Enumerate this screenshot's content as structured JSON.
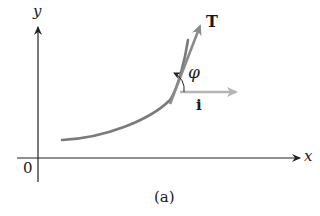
{
  "figure": {
    "caption": "(a)",
    "axes": {
      "x_label": "x",
      "y_label": "y",
      "origin_label": "0"
    },
    "vectors": {
      "tangent_label": "T",
      "unit_x_label": "i",
      "angle_label": "φ"
    },
    "colors": {
      "axis": "#222222",
      "curve": "#7a7a7a",
      "tangent_vector": "#8a8a8a",
      "unit_vector": "#b4b4b4",
      "text": "#1a1a1a"
    }
  }
}
